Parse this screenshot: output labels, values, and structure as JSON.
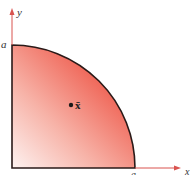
{
  "figure": {
    "shape": "quarter-circle",
    "axes": {
      "x_label": "x",
      "y_label": "y",
      "color": "#d9534f"
    },
    "radius_labels": {
      "y_axis": "a",
      "x_axis": "a"
    },
    "centroid": {
      "label": "x̄",
      "marker": "dot"
    },
    "colors": {
      "fill_dark": "#ef4a3c",
      "fill_light": "#fdf0ee",
      "outline": "#2a1a18"
    }
  }
}
